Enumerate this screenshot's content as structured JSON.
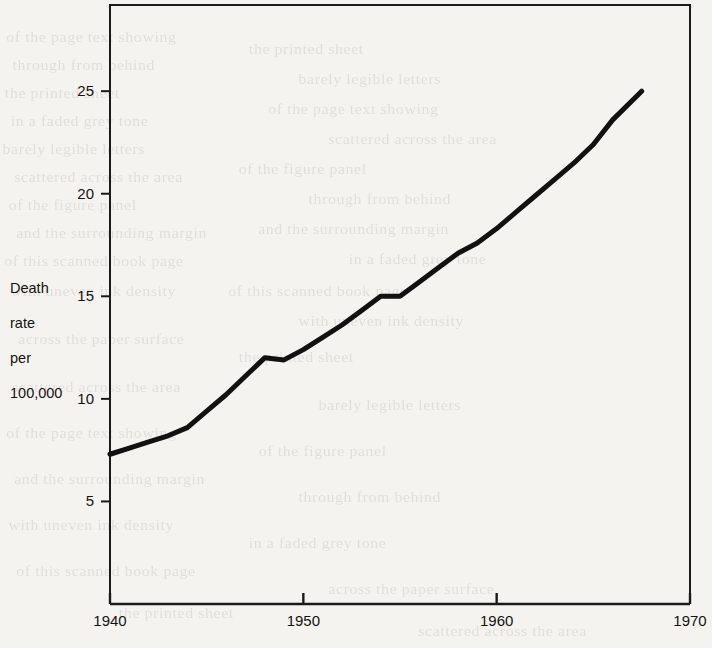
{
  "chart_data": {
    "type": "line",
    "title": "",
    "xlabel": "",
    "ylabel": "Death rate per 100,000",
    "ylabel_lines": [
      "Death",
      "rate",
      "per",
      "100,000"
    ],
    "xlim": [
      1940,
      1970
    ],
    "ylim": [
      0,
      29.2
    ],
    "xticks": [
      1940,
      1950,
      1960,
      1970
    ],
    "xtick_labels": [
      "1940",
      "1950",
      "1960",
      "1970"
    ],
    "yticks": [
      5,
      10,
      15,
      20,
      25
    ],
    "ytick_labels": [
      "5",
      "10",
      "15",
      "20",
      "25"
    ],
    "grid": false,
    "legend": null,
    "line_color": "#111111",
    "line_width": 5,
    "series": [
      {
        "name": "Death rate per 100,000",
        "x": [
          1940,
          1941,
          1942,
          1943,
          1944,
          1945,
          1946,
          1947,
          1948,
          1949,
          1950,
          1951,
          1952,
          1953,
          1954,
          1955,
          1956,
          1957,
          1958,
          1959,
          1960,
          1961,
          1962,
          1963,
          1964,
          1965,
          1966,
          1967.5
        ],
        "values": [
          7.3,
          7.6,
          7.9,
          8.2,
          8.6,
          9.4,
          10.2,
          11.1,
          12.0,
          11.9,
          12.4,
          13.0,
          13.6,
          14.3,
          15.0,
          15.0,
          15.7,
          16.4,
          17.1,
          17.6,
          18.3,
          19.1,
          19.9,
          20.7,
          21.5,
          22.4,
          23.6,
          25.0
        ]
      }
    ],
    "annotations": []
  },
  "axis": {
    "x_tick_labels": [
      "1940",
      "1950",
      "1960",
      "1970"
    ],
    "y_tick_labels": [
      "25",
      "20",
      "15",
      "10",
      "5"
    ],
    "y_title_line1": "Death",
    "y_title_line2": "rate",
    "y_title_line3": "per",
    "y_title_line4": "100,000"
  },
  "background_showthrough": {
    "note": "faint mirrored text bleeding through from the reverse side of the scanned page",
    "lines": [
      "of the page text showing",
      "through from behind",
      "the printed sheet",
      "in a faded grey tone",
      "barely legible letters",
      "scattered across the area",
      "of the figure panel",
      "and the surrounding margin",
      "of this scanned book page",
      "with uneven ink density",
      "across the paper surface"
    ]
  }
}
